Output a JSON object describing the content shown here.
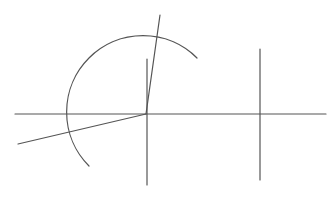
{
  "diagram": {
    "width": 336,
    "height": 200,
    "stroke_color": "#555555",
    "background": "#ffffff",
    "center": [
      146,
      114
    ],
    "lines": [
      {
        "name": "horizontal-axis-line",
        "x1": 15,
        "y1": 114,
        "x2": 326,
        "y2": 114
      },
      {
        "name": "central-vertical-line",
        "x1": 147,
        "y1": 59,
        "x2": 147,
        "y2": 185
      },
      {
        "name": "steep-ray-line",
        "x1": 146,
        "y1": 114,
        "x2": 160,
        "y2": 15
      },
      {
        "name": "lower-left-ray-line",
        "x1": 146,
        "y1": 114,
        "x2": 18,
        "y2": 144
      },
      {
        "name": "right-vertical-line",
        "x1": 260,
        "y1": 49,
        "x2": 260,
        "y2": 180
      }
    ],
    "arc": {
      "name": "circle-arc",
      "cx": 146,
      "cy": 114,
      "r": 76,
      "start": [
        197,
        58
      ],
      "end": [
        89,
        166
      ]
    }
  }
}
